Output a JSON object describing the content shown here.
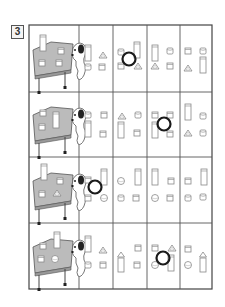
{
  "question": {
    "number": "3"
  },
  "grid": {
    "left": 29,
    "top": 25,
    "right": 212,
    "bottom": 289,
    "col_x": [
      29,
      79,
      113,
      147,
      180,
      212
    ],
    "row_y": [
      25,
      92,
      157,
      223,
      289
    ],
    "line_color": "#444444"
  },
  "rows": [
    {
      "reference": "table-with-blocks-and-dog",
      "options": [
        {
          "shapes": [
            "tall-box",
            "triangle",
            "small-cylinder",
            "small-box"
          ],
          "circled": false
        },
        {
          "shapes": [
            "small-cylinder",
            "tall-box",
            "small-box",
            "triangle"
          ],
          "circled": true
        },
        {
          "shapes": [
            "tall-box",
            "small-cylinder",
            "triangle",
            "small-box"
          ],
          "circled": false
        },
        {
          "shapes": [
            "small-box",
            "small-cylinder",
            "triangle",
            "tall-cylinder"
          ],
          "circled": false
        }
      ]
    },
    {
      "reference": "table-with-blocks-and-dog",
      "options": [
        {
          "shapes": [
            "small-cylinder",
            "small-box",
            "tall-box",
            "small-box"
          ],
          "circled": false
        },
        {
          "shapes": [
            "triangle",
            "small-cylinder",
            "tall-box",
            "small-box"
          ],
          "circled": false
        },
        {
          "shapes": [
            "small-box",
            "small-box",
            "tall-box",
            "small-box"
          ],
          "circled": true
        },
        {
          "shapes": [
            "tall-box",
            "small-cylinder",
            "triangle",
            "small-cylinder"
          ],
          "circled": false
        }
      ]
    },
    {
      "reference": "table-with-blocks-and-dog",
      "options": [
        {
          "shapes": [
            "small-box",
            "tall-box",
            "small-box",
            "ball"
          ],
          "circled": true
        },
        {
          "shapes": [
            "ball",
            "tall-box",
            "small-cylinder",
            "small-box"
          ],
          "circled": false
        },
        {
          "shapes": [
            "tall-box",
            "small-box",
            "ball",
            "small-box"
          ],
          "circled": false
        },
        {
          "shapes": [
            "small-box",
            "tall-box",
            "small-cylinder",
            "small-cylinder"
          ],
          "circled": false
        }
      ]
    },
    {
      "reference": "table-with-blocks-and-dog",
      "options": [
        {
          "shapes": [
            "tall-box",
            "triangle",
            "small-cylinder",
            "small-box"
          ],
          "circled": false
        },
        {
          "shapes": [
            "triangle-on-tall-box",
            "small-box",
            "small-box"
          ],
          "circled": false
        },
        {
          "shapes": [
            "small-box",
            "triangle",
            "ball",
            "tall-box"
          ],
          "circled": true
        },
        {
          "shapes": [
            "small-box",
            "triangle-on-tall-box",
            "ball"
          ],
          "circled": false
        }
      ]
    }
  ],
  "colors": {
    "ink": "#333333",
    "shape_stroke": "#888888",
    "table_fill": "#b8b8b8",
    "circle": "#1a1a1a"
  }
}
